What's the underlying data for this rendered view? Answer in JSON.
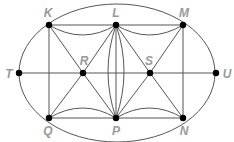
{
  "diagram": {
    "type": "graph",
    "colors": {
      "edge": "#555555",
      "node": "#000000",
      "label": "#9a9a9a",
      "background": "#ffffff"
    },
    "ellipse": {
      "cx": 117,
      "cy": 73,
      "rx": 98,
      "ry": 69
    },
    "nodes": [
      {
        "id": "K",
        "label": "K",
        "x": 49,
        "y": 25,
        "lx": 48,
        "ly": 17,
        "anchor": "middle"
      },
      {
        "id": "L",
        "label": "L",
        "x": 116,
        "y": 25,
        "lx": 116,
        "ly": 17,
        "anchor": "middle"
      },
      {
        "id": "M",
        "label": "M",
        "x": 183,
        "y": 25,
        "lx": 184,
        "ly": 17,
        "anchor": "middle"
      },
      {
        "id": "T",
        "label": "T",
        "x": 19,
        "y": 73,
        "lx": 9,
        "ly": 78,
        "anchor": "middle"
      },
      {
        "id": "R",
        "label": "R",
        "x": 83,
        "y": 73,
        "lx": 84,
        "ly": 65,
        "anchor": "middle"
      },
      {
        "id": "S",
        "label": "S",
        "x": 150,
        "y": 73,
        "lx": 149,
        "ly": 65,
        "anchor": "middle"
      },
      {
        "id": "U",
        "label": "U",
        "x": 216,
        "y": 73,
        "lx": 227,
        "ly": 78,
        "anchor": "middle"
      },
      {
        "id": "Q",
        "label": "Q",
        "x": 49,
        "y": 118,
        "lx": 48,
        "ly": 135,
        "anchor": "middle"
      },
      {
        "id": "P",
        "label": "P",
        "x": 116,
        "y": 118,
        "lx": 116,
        "ly": 135,
        "anchor": "middle"
      },
      {
        "id": "N",
        "label": "N",
        "x": 183,
        "y": 118,
        "lx": 184,
        "ly": 135,
        "anchor": "middle"
      }
    ],
    "edges": [
      {
        "from": "T",
        "to": "U",
        "kind": "straight"
      },
      {
        "from": "K",
        "to": "Q",
        "kind": "straight"
      },
      {
        "from": "M",
        "to": "N",
        "kind": "straight"
      },
      {
        "from": "L",
        "to": "P",
        "kind": "straight"
      },
      {
        "from": "L",
        "to": "P",
        "kind": "curve",
        "bend": "left"
      },
      {
        "from": "L",
        "to": "P",
        "kind": "curve",
        "bend": "right"
      },
      {
        "from": "K",
        "to": "L",
        "kind": "straight"
      },
      {
        "from": "K",
        "to": "L",
        "kind": "curve",
        "bend": "down"
      },
      {
        "from": "L",
        "to": "M",
        "kind": "straight"
      },
      {
        "from": "L",
        "to": "M",
        "kind": "curve",
        "bend": "down"
      },
      {
        "from": "Q",
        "to": "P",
        "kind": "straight"
      },
      {
        "from": "Q",
        "to": "P",
        "kind": "curve",
        "bend": "up"
      },
      {
        "from": "P",
        "to": "N",
        "kind": "straight"
      },
      {
        "from": "P",
        "to": "N",
        "kind": "curve",
        "bend": "up"
      },
      {
        "from": "K",
        "to": "R",
        "kind": "straight"
      },
      {
        "from": "L",
        "to": "R",
        "kind": "straight"
      },
      {
        "from": "Q",
        "to": "R",
        "kind": "straight"
      },
      {
        "from": "P",
        "to": "R",
        "kind": "straight"
      },
      {
        "from": "L",
        "to": "S",
        "kind": "straight"
      },
      {
        "from": "M",
        "to": "S",
        "kind": "straight"
      },
      {
        "from": "P",
        "to": "S",
        "kind": "straight"
      },
      {
        "from": "N",
        "to": "S",
        "kind": "straight"
      },
      {
        "from": "K",
        "to": "M",
        "kind": "ellipse-arc"
      },
      {
        "from": "M",
        "to": "U",
        "kind": "ellipse-arc"
      },
      {
        "from": "U",
        "to": "N",
        "kind": "ellipse-arc"
      },
      {
        "from": "N",
        "to": "Q",
        "kind": "ellipse-arc"
      },
      {
        "from": "Q",
        "to": "T",
        "kind": "ellipse-arc"
      },
      {
        "from": "T",
        "to": "K",
        "kind": "ellipse-arc"
      }
    ]
  }
}
